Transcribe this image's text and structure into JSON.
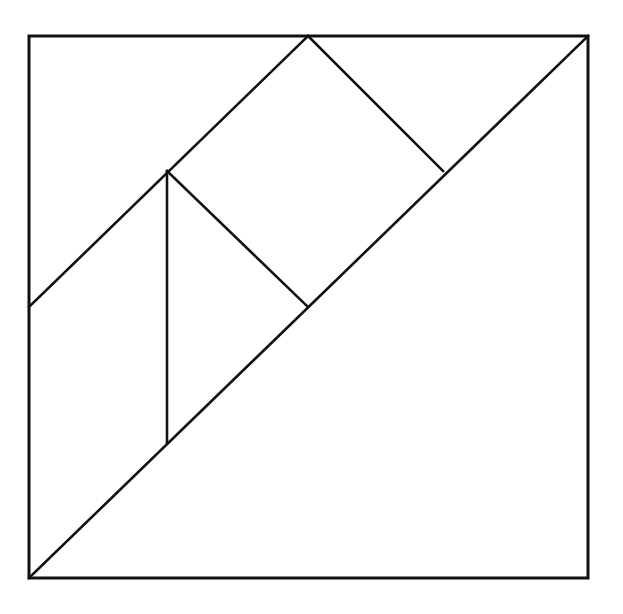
{
  "figure": {
    "background_color": "#ffffff",
    "line_color": "#111111",
    "line_width": 2.6,
    "outline_width": 3,
    "canvas": {
      "width": 623,
      "height": 614
    }
  },
  "square": {
    "name": "bounding-square",
    "corners": {
      "top_left": [
        29,
        36
      ],
      "top_right": [
        588,
        36
      ],
      "bottom_right": [
        588,
        578
      ],
      "bottom_left": [
        29,
        578
      ]
    },
    "width": 559,
    "height": 542,
    "path": "M 29 36 L 588 36 L 588 578 L 29 578 Z"
  },
  "key_points": {
    "top_left": [
      29,
      36
    ],
    "top_mid": [
      308,
      36
    ],
    "top_right": [
      588,
      36
    ],
    "left_mid": [
      29,
      307
    ],
    "center": [
      308,
      307
    ],
    "right_upper_mid": [
      443,
      171
    ],
    "upper_left_quarter": [
      167,
      171
    ],
    "lower_left_vertical_end": [
      167,
      443
    ],
    "bottom_left": [
      29,
      578
    ],
    "bottom_right": [
      588,
      578
    ]
  },
  "cut_lines": [
    {
      "name": "main-diagonal",
      "from": [
        29,
        578
      ],
      "to": [
        588,
        36
      ],
      "orientation": "rising-diagonal"
    },
    {
      "name": "anti-diagonal-upper-left",
      "from": [
        29,
        307
      ],
      "to": [
        308,
        36
      ],
      "orientation": "rising-diagonal"
    },
    {
      "name": "anti-diagonal-upper-right",
      "from": [
        308,
        36
      ],
      "to": [
        443,
        171
      ],
      "orientation": "falling-diagonal"
    },
    {
      "name": "medium-diagonal-to-center",
      "from": [
        167,
        171
      ],
      "to": [
        308,
        307
      ],
      "orientation": "falling-diagonal"
    },
    {
      "name": "vertical-divider",
      "from": [
        167,
        171
      ],
      "to": [
        167,
        443
      ],
      "orientation": "vertical"
    }
  ],
  "pieces": [
    {
      "name": "large-triangle-lower-right",
      "type": "large-triangle",
      "vertices": [
        [
          588,
          36
        ],
        [
          588,
          578
        ],
        [
          29,
          578
        ]
      ]
    },
    {
      "name": "large-triangle-upper-left",
      "type": "large-triangle",
      "vertices": [
        [
          29,
          36
        ],
        [
          308,
          36
        ],
        [
          29,
          307
        ]
      ]
    },
    {
      "name": "medium-triangle",
      "type": "medium-triangle",
      "vertices": [
        [
          29,
          307
        ],
        [
          167,
          443
        ],
        [
          29,
          578
        ]
      ]
    },
    {
      "name": "small-triangle-upper",
      "type": "small-triangle",
      "vertices": [
        [
          308,
          36
        ],
        [
          443,
          171
        ],
        [
          308,
          307
        ]
      ]
    },
    {
      "name": "small-triangle-lower",
      "type": "small-triangle",
      "vertices": [
        [
          167,
          171
        ],
        [
          308,
          307
        ],
        [
          167,
          443
        ]
      ]
    },
    {
      "name": "square-piece",
      "type": "square",
      "vertices": [
        [
          167,
          171
        ],
        [
          308,
          36
        ],
        [
          443,
          171
        ],
        [
          308,
          307
        ]
      ]
    },
    {
      "name": "parallelogram-piece",
      "type": "parallelogram",
      "vertices": [
        [
          29,
          307
        ],
        [
          167,
          171
        ],
        [
          167,
          443
        ]
      ]
    }
  ]
}
